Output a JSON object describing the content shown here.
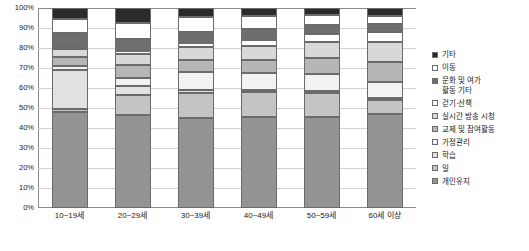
{
  "chart_data": {
    "type": "bar",
    "subtype": "100% stacked bar",
    "title": "",
    "xlabel": "",
    "ylabel": "",
    "ylim": [
      0,
      100
    ],
    "grid": true,
    "legend_position": "right",
    "categories": [
      "10~19세",
      "20~29세",
      "30~39세",
      "40~49세",
      "50~59세",
      "60세 이상"
    ],
    "ytick_labels": [
      "0%",
      "10%",
      "20%",
      "30%",
      "40%",
      "50%",
      "60%",
      "70%",
      "80%",
      "90%",
      "100%"
    ],
    "ytick_values": [
      0,
      10,
      20,
      30,
      40,
      50,
      60,
      70,
      80,
      90,
      100
    ],
    "series": [
      {
        "name": "개인유지",
        "color": "#939393",
        "values": [
          48.0,
          46.5,
          45.0,
          45.5,
          45.5,
          47.0
        ]
      },
      {
        "name": "일",
        "color": "#c4c4c4",
        "values": [
          1.5,
          10.0,
          12.5,
          12.5,
          12.0,
          7.0
        ]
      },
      {
        "name": "학습",
        "color": "#e2e2e2",
        "values": [
          19.5,
          4.5,
          1.5,
          1.0,
          1.0,
          1.0
        ]
      },
      {
        "name": "가정관리",
        "color": "#f2f2f2",
        "values": [
          2.0,
          4.0,
          9.0,
          8.5,
          8.5,
          8.0
        ]
      },
      {
        "name": "교제 및 참여활동",
        "color": "#b6b6b6",
        "values": [
          4.5,
          6.5,
          6.0,
          6.5,
          8.0,
          10.0
        ]
      },
      {
        "name": "실시간 방송 시청",
        "color": "#d8d8d8",
        "values": [
          4.0,
          5.5,
          6.5,
          7.0,
          8.0,
          10.0
        ]
      },
      {
        "name": "걷기·산책",
        "color": "#ffffff",
        "values": [
          1.0,
          1.5,
          2.0,
          3.0,
          4.0,
          5.0
        ]
      },
      {
        "name": "문화 및 여가\n활동 기타",
        "color": "#6e6e6e",
        "values": [
          7.0,
          6.0,
          5.5,
          5.5,
          4.5,
          4.0
        ]
      },
      {
        "name": "이동",
        "color": "#ffffff",
        "values": [
          7.0,
          8.0,
          7.5,
          6.5,
          5.0,
          4.0
        ]
      },
      {
        "name": "기타",
        "color": "#2b2b2b",
        "values": [
          5.5,
          7.5,
          4.5,
          4.0,
          3.5,
          4.0
        ]
      }
    ],
    "legend_order_top_to_bottom": [
      "기타",
      "이동",
      "문화 및 여가\n활동 기타",
      "걷기·산책",
      "실시간 방송 시청",
      "교제 및 참여활동",
      "가정관리",
      "학습",
      "일",
      "개인유지"
    ],
    "colors": {
      "axis": "#8a8a8a",
      "grid": "#d2d2d2",
      "text": "#1a1a1a",
      "background": "#ffffff",
      "segment_border": "#6b6b6b"
    }
  }
}
